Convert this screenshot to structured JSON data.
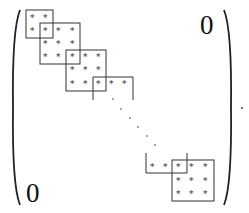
{
  "figure": {
    "type": "block-tridiagonal-matrix",
    "entry_symbol": "*",
    "zero_upper": "0",
    "zero_lower": "0",
    "trailing_punctuation": ".",
    "colors": {
      "ink": "#111111",
      "box": "#333333",
      "star": "#333333"
    }
  },
  "blocks": [
    {
      "id": 1,
      "rows": 2,
      "cols": 2,
      "border": "closed"
    },
    {
      "id": 2,
      "rows": 3,
      "cols": 3,
      "border": "closed"
    },
    {
      "id": 3,
      "rows": 3,
      "cols": 3,
      "border": "closed"
    },
    {
      "id": 4,
      "rows": 1,
      "cols": 3,
      "border": "open-bottom"
    },
    {
      "id": 5,
      "rows": 1,
      "cols": 3,
      "border": "open-top"
    },
    {
      "id": 6,
      "rows": 3,
      "cols": 3,
      "border": "closed"
    }
  ],
  "diagonal_dots": 6
}
